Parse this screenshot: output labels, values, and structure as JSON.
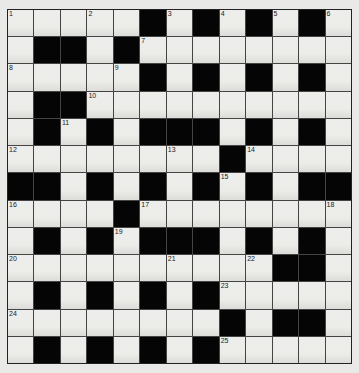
{
  "puzzle": {
    "type": "crossword",
    "rows": 13,
    "cols": 13,
    "layout": [
      "WWWWWBWBWBWBW",
      "WBBWBWWWWWWWW",
      "WWWWWBWBWBWBW",
      "WBBWWWWWWWWWW",
      "WBWBWBBBWBWBW",
      "WWWWWWWWBWWWW",
      "BBWBWBWBWBWBB",
      "WWWWBWWWWWWWW",
      "WBWBWBBBWBWBW",
      "WWWWWWWWWWBBW",
      "WBWBWBWBWWWWW",
      "WWWWWWWWBWBBW",
      "WBWBWBWBWWWWW"
    ],
    "numbers": [
      {
        "row": 0,
        "col": 0,
        "n": "1"
      },
      {
        "row": 0,
        "col": 3,
        "n": "2"
      },
      {
        "row": 0,
        "col": 6,
        "n": "3"
      },
      {
        "row": 0,
        "col": 8,
        "n": "4"
      },
      {
        "row": 0,
        "col": 10,
        "n": "5"
      },
      {
        "row": 0,
        "col": 12,
        "n": "6"
      },
      {
        "row": 1,
        "col": 5,
        "n": "7"
      },
      {
        "row": 2,
        "col": 0,
        "n": "8"
      },
      {
        "row": 2,
        "col": 4,
        "n": "9"
      },
      {
        "row": 3,
        "col": 3,
        "n": "10"
      },
      {
        "row": 4,
        "col": 2,
        "n": "11"
      },
      {
        "row": 5,
        "col": 0,
        "n": "12"
      },
      {
        "row": 5,
        "col": 6,
        "n": "13"
      },
      {
        "row": 5,
        "col": 9,
        "n": "14"
      },
      {
        "row": 6,
        "col": 8,
        "n": "15"
      },
      {
        "row": 7,
        "col": 0,
        "n": "16"
      },
      {
        "row": 7,
        "col": 5,
        "n": "17"
      },
      {
        "row": 7,
        "col": 12,
        "n": "18"
      },
      {
        "row": 8,
        "col": 4,
        "n": "19"
      },
      {
        "row": 9,
        "col": 0,
        "n": "20"
      },
      {
        "row": 9,
        "col": 6,
        "n": "21"
      },
      {
        "row": 9,
        "col": 9,
        "n": "22"
      },
      {
        "row": 10,
        "col": 8,
        "n": "23"
      },
      {
        "row": 11,
        "col": 0,
        "n": "24"
      },
      {
        "row": 12,
        "col": 8,
        "n": "25"
      }
    ]
  }
}
